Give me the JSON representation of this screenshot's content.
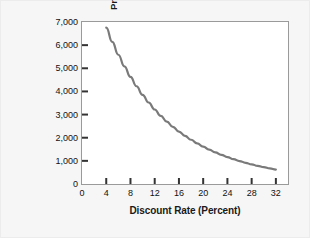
{
  "chart_data": {
    "type": "line",
    "title": "",
    "xlabel": "Discount Rate (Percent)",
    "ylabel_line1": "Present Value of $10,000 Payment",
    "ylabel_line2": "to Be Received in 10 Years",
    "xlim": [
      0,
      34
    ],
    "ylim": [
      0,
      7000
    ],
    "xticks": [
      0,
      4,
      8,
      12,
      16,
      20,
      24,
      28,
      32
    ],
    "xticklabels": [
      "0",
      "4",
      "8",
      "12",
      "16",
      "20",
      "24",
      "28",
      "32"
    ],
    "yticks": [
      0,
      1000,
      2000,
      3000,
      4000,
      5000,
      6000,
      7000
    ],
    "yticklabels": [
      "0",
      "1,000",
      "2,000",
      "3,000",
      "4,000",
      "5,000",
      "6,000",
      "7,000"
    ],
    "grid": false,
    "legend": "none",
    "series": [
      {
        "name": "Present Value of $10,000 in 10 Years",
        "color": "#7a7a7a",
        "x": [
          4,
          5,
          6,
          7,
          8,
          9,
          10,
          11,
          12,
          13,
          14,
          15,
          16,
          17,
          18,
          19,
          20,
          21,
          22,
          23,
          24,
          25,
          26,
          27,
          28,
          29,
          30,
          31,
          32
        ],
        "values": [
          6756,
          6139,
          5584,
          5083,
          4632,
          4224,
          3855,
          3522,
          3220,
          2946,
          2697,
          2472,
          2267,
          2080,
          1911,
          1756,
          1615,
          1486,
          1369,
          1262,
          1164,
          1074,
          992,
          916,
          847,
          784,
          725,
          672,
          624
        ]
      }
    ]
  },
  "axis": {
    "y_axis_name": "present-value-axis",
    "x_axis_name": "discount-rate-axis"
  }
}
